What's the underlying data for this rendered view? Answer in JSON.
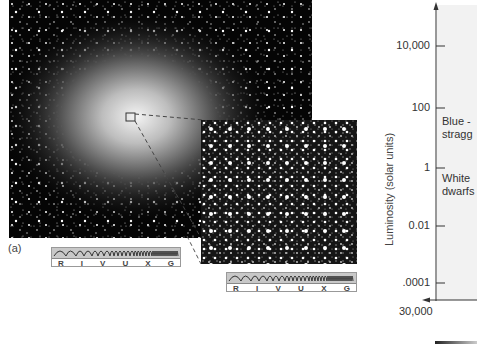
{
  "figure": {
    "panel_label": "(a)",
    "main_image": {
      "description": "globular cluster star field",
      "colors": {
        "background": "#050505",
        "star": "#ffffff"
      }
    },
    "inset_image": {
      "description": "magnified core of cluster"
    },
    "spectrum_bars": [
      {
        "letters": [
          "R",
          "I",
          "V",
          "U",
          "X",
          "G"
        ],
        "highlighted": "V"
      },
      {
        "letters": [
          "R",
          "I",
          "V",
          "U",
          "X",
          "G"
        ],
        "highlighted": "V"
      }
    ]
  },
  "hr_diagram": {
    "ylabel": "Luminosity (solar units)",
    "y_ticks": [
      "10,000",
      "100",
      "1",
      "0.01",
      ".0001"
    ],
    "x_ticks": [
      "30,000"
    ],
    "annotations": [
      {
        "line1": "Blue -",
        "line2": "stragg"
      },
      {
        "line1": "White",
        "line2": "dwarfs"
      }
    ]
  }
}
